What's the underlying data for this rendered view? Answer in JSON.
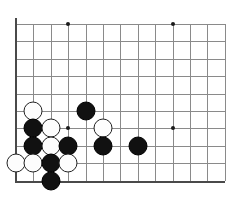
{
  "board": {
    "title": "Go board corner diagram",
    "board_size": 19,
    "visible_columns": 12,
    "visible_rows": 10,
    "cell_size": 17.4,
    "origin_x": 16,
    "origin_y": 24,
    "line_color": "#8a8a8a",
    "edge_color": "#4a4a4a",
    "background_color": "#ffffff",
    "black_color": "#111111",
    "white_color": "#fdfdfd",
    "edges": [
      {
        "name": "left-edge",
        "orientation": "v"
      },
      {
        "name": "bottom-edge",
        "orientation": "h"
      }
    ],
    "hoshi_points": [
      {
        "col": 3,
        "row": 0,
        "label": "star-point-top-left"
      },
      {
        "col": 9,
        "row": 0,
        "label": "star-point-top-right"
      },
      {
        "col": 3,
        "row": 6,
        "label": "star-point-lower-left"
      },
      {
        "col": 9,
        "row": 6,
        "label": "star-point-lower-right"
      }
    ],
    "stones": [
      {
        "id": 1,
        "color": "black",
        "col": 4,
        "row": 5,
        "label": "black-stone-d5"
      },
      {
        "id": 2,
        "color": "white",
        "col": 1,
        "row": 5,
        "label": "white-stone-a5"
      },
      {
        "id": 3,
        "color": "black",
        "col": 1,
        "row": 6,
        "label": "black-stone-a6"
      },
      {
        "id": 4,
        "color": "white",
        "col": 2,
        "row": 6,
        "label": "white-stone-b6"
      },
      {
        "id": 5,
        "color": "white",
        "col": 5,
        "row": 6,
        "label": "white-stone-e6"
      },
      {
        "id": 6,
        "color": "black",
        "col": 1,
        "row": 7,
        "label": "black-stone-a7"
      },
      {
        "id": 7,
        "color": "white",
        "col": 2,
        "row": 7,
        "label": "white-stone-b7"
      },
      {
        "id": 8,
        "color": "black",
        "col": 3,
        "row": 7,
        "label": "black-stone-c7"
      },
      {
        "id": 9,
        "color": "black",
        "col": 5,
        "row": 7,
        "label": "black-stone-e7"
      },
      {
        "id": 10,
        "color": "black",
        "col": 7,
        "row": 7,
        "label": "black-stone-g7"
      },
      {
        "id": 11,
        "color": "white",
        "col": 0,
        "row": 8,
        "label": "white-stone-edge-8"
      },
      {
        "id": 12,
        "color": "white",
        "col": 1,
        "row": 8,
        "label": "white-stone-a8"
      },
      {
        "id": 13,
        "color": "black",
        "col": 2,
        "row": 8,
        "label": "black-stone-b8"
      },
      {
        "id": 14,
        "color": "white",
        "col": 3,
        "row": 8,
        "label": "white-stone-c8"
      },
      {
        "id": 15,
        "color": "black",
        "col": 2,
        "row": 9,
        "label": "black-stone-b9"
      }
    ]
  }
}
